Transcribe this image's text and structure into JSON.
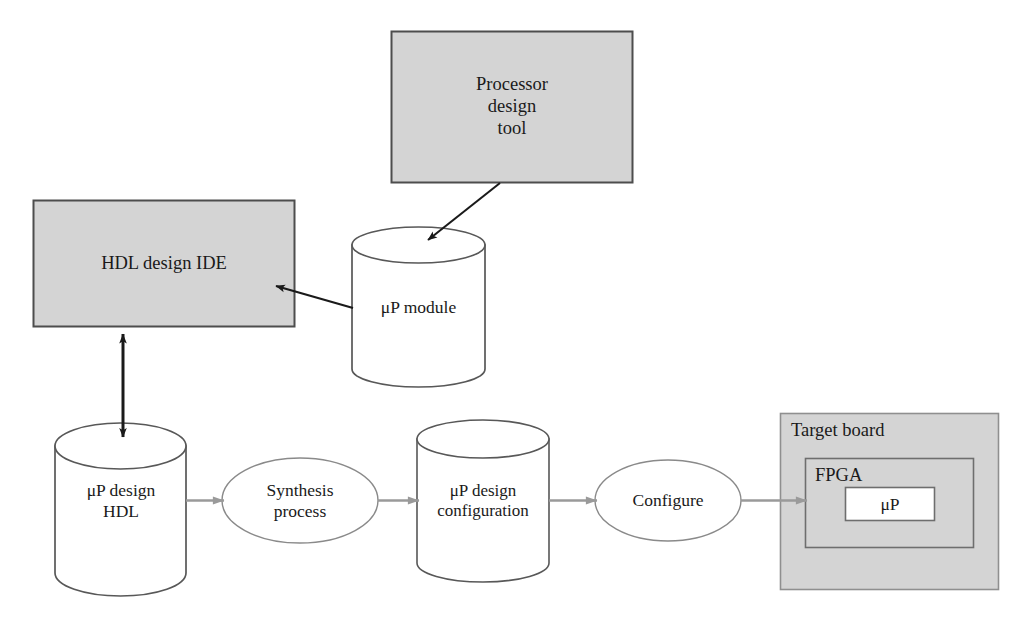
{
  "diagram": {
    "type": "flow-diagram",
    "canvas": {
      "width": 1031,
      "height": 626,
      "background": "#ffffff"
    },
    "colors": {
      "box_fill": "#d4d4d4",
      "box_stroke": "#4d4d4d",
      "cylinder_fill": "#ffffff",
      "cylinder_stroke": "#585858",
      "ellipse_stroke": "#8a8a8a",
      "arrow_dark": "#1a1a1a",
      "arrow_gray": "#9a9a9a",
      "inner_box_fill": "#ffffff",
      "text": "#1a1a1a"
    },
    "nodes": [
      {
        "id": "processor-design-tool",
        "shape": "rectangle",
        "label": "Processor\ndesign\ntool",
        "fill": "#d4d4d4",
        "x": 391,
        "y": 31,
        "w": 242,
        "h": 152
      },
      {
        "id": "hdl-design-ide",
        "shape": "rectangle",
        "label": "HDL design IDE",
        "fill": "#d4d4d4",
        "x": 33,
        "y": 200,
        "w": 262,
        "h": 127
      },
      {
        "id": "up-module",
        "shape": "cylinder",
        "label": "μP module",
        "fill": "#ffffff",
        "x": 352,
        "y": 228,
        "w": 133,
        "h": 158
      },
      {
        "id": "up-design-hdl",
        "shape": "cylinder",
        "label": "μP design\nHDL",
        "fill": "#ffffff",
        "x": 55,
        "y": 425,
        "w": 131,
        "h": 172
      },
      {
        "id": "synthesis-process",
        "shape": "ellipse",
        "label": "Synthesis\nprocess",
        "fill": "#ffffff",
        "x": 222,
        "y": 458,
        "w": 156,
        "h": 85
      },
      {
        "id": "up-design-configuration",
        "shape": "cylinder",
        "label": "μP design\nconfiguration",
        "fill": "#ffffff",
        "x": 417,
        "y": 421,
        "w": 132,
        "h": 160
      },
      {
        "id": "configure",
        "shape": "ellipse",
        "label": "Configure",
        "fill": "#ffffff",
        "x": 595,
        "y": 460,
        "w": 146,
        "h": 80
      },
      {
        "id": "target-board",
        "shape": "rectangle",
        "label": "Target board",
        "label_position": "top-left",
        "fill": "#d4d4d4",
        "x": 780,
        "y": 413,
        "w": 219,
        "h": 177
      },
      {
        "id": "fpga",
        "shape": "rectangle",
        "label": "FPGA",
        "label_position": "top-left",
        "fill": "#d4d4d4",
        "x": 805,
        "y": 458,
        "w": 169,
        "h": 90
      },
      {
        "id": "up",
        "shape": "rectangle",
        "label": "μP",
        "fill": "#ffffff",
        "x": 845,
        "y": 487,
        "w": 90,
        "h": 34
      }
    ],
    "edges": [
      {
        "id": "edge-tool-to-module",
        "from": "processor-design-tool",
        "to": "up-module",
        "style": "solid-dark",
        "arrowheads": "end"
      },
      {
        "id": "edge-module-to-ide",
        "from": "up-module",
        "to": "hdl-design-ide",
        "style": "solid-dark",
        "arrowheads": "end"
      },
      {
        "id": "edge-ide-hdl-bidirectional",
        "from": "hdl-design-ide",
        "to": "up-design-hdl",
        "style": "solid-dark",
        "arrowheads": "both"
      },
      {
        "id": "edge-hdl-to-synthesis",
        "from": "up-design-hdl",
        "to": "synthesis-process",
        "style": "solid-gray",
        "arrowheads": "end"
      },
      {
        "id": "edge-synthesis-to-config",
        "from": "synthesis-process",
        "to": "up-design-configuration",
        "style": "solid-gray",
        "arrowheads": "end"
      },
      {
        "id": "edge-config-to-configure",
        "from": "up-design-configuration",
        "to": "configure",
        "style": "solid-gray",
        "arrowheads": "end"
      },
      {
        "id": "edge-configure-to-target",
        "from": "configure",
        "to": "target-board",
        "style": "solid-gray",
        "arrowheads": "end"
      }
    ]
  }
}
